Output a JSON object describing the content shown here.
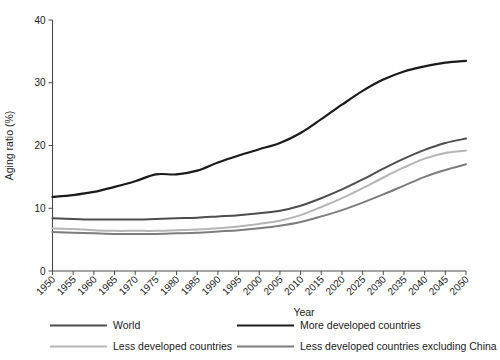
{
  "chart_data": {
    "type": "line",
    "title": "",
    "xlabel": "Year",
    "ylabel": "Aging ratio (%)",
    "xlim": [
      1950,
      2050
    ],
    "ylim": [
      0,
      40
    ],
    "yticks": [
      0,
      10,
      20,
      30,
      40
    ],
    "ytick_labels": [
      "0",
      "10",
      "20",
      "30",
      "40"
    ],
    "x": [
      1950,
      1955,
      1960,
      1965,
      1970,
      1975,
      1980,
      1985,
      1990,
      1995,
      2000,
      2005,
      2010,
      2015,
      2020,
      2025,
      2030,
      2035,
      2040,
      2045,
      2050
    ],
    "xtick_labels": [
      "1950",
      "1955",
      "1960",
      "1965",
      "1970",
      "1975",
      "1980",
      "1985",
      "1990",
      "1995",
      "2000",
      "2005",
      "2010",
      "2015",
      "2020",
      "2025",
      "2030",
      "2035",
      "2040",
      "2045",
      "2050"
    ],
    "grid": false,
    "legend_position": "bottom",
    "series": [
      {
        "name": "World",
        "color": "#4d4d4d",
        "width": 2.0,
        "values": [
          8.4,
          8.3,
          8.2,
          8.2,
          8.2,
          8.3,
          8.4,
          8.5,
          8.7,
          8.9,
          9.2,
          9.6,
          10.4,
          11.6,
          13.0,
          14.6,
          16.3,
          17.9,
          19.3,
          20.4,
          21.1
        ]
      },
      {
        "name": "More developed countries",
        "color": "#1a1a1a",
        "width": 2.2,
        "values": [
          11.8,
          12.1,
          12.6,
          13.4,
          14.3,
          15.4,
          15.4,
          16.0,
          17.3,
          18.4,
          19.4,
          20.4,
          22.0,
          24.2,
          26.5,
          28.7,
          30.5,
          31.8,
          32.6,
          33.2,
          33.5
        ]
      },
      {
        "name": "Less developed countries",
        "color": "#b5b5b5",
        "width": 2.0,
        "values": [
          6.8,
          6.7,
          6.5,
          6.4,
          6.4,
          6.4,
          6.5,
          6.6,
          6.8,
          7.1,
          7.5,
          8.0,
          8.9,
          10.2,
          11.6,
          13.2,
          14.9,
          16.5,
          17.9,
          18.8,
          19.2
        ]
      },
      {
        "name": "Less developed countries excluding China",
        "color": "#7d7d7d",
        "width": 2.0,
        "values": [
          6.2,
          6.1,
          6.0,
          5.9,
          5.9,
          5.9,
          6.0,
          6.1,
          6.3,
          6.5,
          6.8,
          7.2,
          7.8,
          8.7,
          9.7,
          10.9,
          12.2,
          13.6,
          15.0,
          16.1,
          17.0
        ]
      }
    ]
  },
  "legend": {
    "entries": [
      {
        "label": "World",
        "color": "#4d4d4d"
      },
      {
        "label": "More developed countries",
        "color": "#1a1a1a"
      },
      {
        "label": "Less developed countries",
        "color": "#b5b5b5"
      },
      {
        "label": "Less developed countries excluding China",
        "color": "#7d7d7d"
      }
    ]
  }
}
